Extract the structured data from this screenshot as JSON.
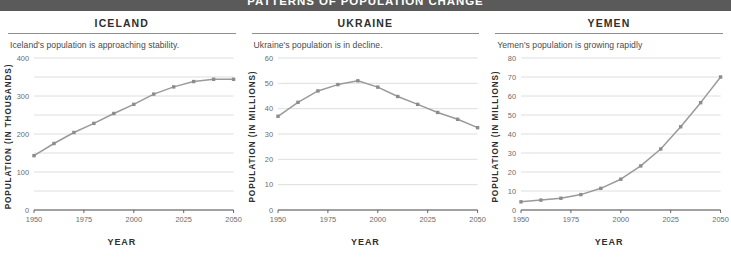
{
  "banner": {
    "title": "PATTERNS OF POPULATION CHANGE",
    "bg_color": "#5a5a5a",
    "text_color": "#ffffff"
  },
  "style": {
    "line_color": "#9a9a9a",
    "marker_color": "#8c8c8c",
    "grid_color": "#d6d6d6",
    "axis_color": "#555555",
    "tick_text_color": "#6b6b6b"
  },
  "panels": [
    {
      "country": "ICELAND",
      "subtitle": "Iceland's population is approaching stability.",
      "chart_index": 0
    },
    {
      "country": "UKRAINE",
      "subtitle": "Ukraine's population is in decline.",
      "chart_index": 1
    },
    {
      "country": "YEMEN",
      "subtitle": "Yemen's population is growing rapidly",
      "chart_index": 2
    }
  ],
  "chart_data": [
    {
      "type": "line",
      "title": "ICELAND",
      "xlabel": "YEAR",
      "ylabel": "POPULATION (IN THOUSANDS)",
      "x": [
        1950,
        1960,
        1970,
        1980,
        1990,
        2000,
        2010,
        2020,
        2030,
        2040,
        2050
      ],
      "values": [
        143,
        175,
        204,
        228,
        254,
        278,
        305,
        324,
        338,
        344,
        344
      ],
      "xlim": [
        1950,
        2050
      ],
      "ylim": [
        0,
        400
      ],
      "ytick_labels": [
        0,
        100,
        200,
        300,
        400
      ],
      "ygrid_step": 50,
      "xtick_labels": [
        1950,
        1975,
        2000,
        2025,
        2050
      ],
      "grid": true,
      "legend": "none",
      "marker": "square"
    },
    {
      "type": "line",
      "title": "UKRAINE",
      "xlabel": "YEAR",
      "ylabel": "POPULATION (IN MILLIONS)",
      "x": [
        1950,
        1960,
        1970,
        1980,
        1990,
        2000,
        2010,
        2020,
        2030,
        2040,
        2050
      ],
      "values": [
        37,
        42.5,
        47,
        49.5,
        51,
        48.5,
        44.8,
        41.7,
        38.5,
        35.8,
        32.5
      ],
      "xlim": [
        1950,
        2050
      ],
      "ylim": [
        0,
        60
      ],
      "ytick_labels": [
        0,
        10,
        20,
        30,
        40,
        50,
        60
      ],
      "ygrid_step": 10,
      "xtick_labels": [
        1950,
        1975,
        2000,
        2025,
        2050
      ],
      "grid": true,
      "legend": "none",
      "marker": "square"
    },
    {
      "type": "line",
      "title": "YEMEN",
      "xlabel": "YEAR",
      "ylabel": "POPULATION (IN MILLIONS)",
      "x": [
        1950,
        1960,
        1970,
        1980,
        1990,
        2000,
        2010,
        2020,
        2030,
        2040,
        2050
      ],
      "values": [
        4.3,
        5.2,
        6.2,
        8.1,
        11.4,
        16.2,
        23.2,
        32.1,
        43.8,
        56.5,
        70
      ],
      "xlim": [
        1950,
        2050
      ],
      "ylim": [
        0,
        80
      ],
      "ytick_labels": [
        0,
        10,
        20,
        30,
        40,
        50,
        60,
        70,
        80
      ],
      "ygrid_step": 10,
      "xtick_labels": [
        1950,
        1975,
        2000,
        2025,
        2050
      ],
      "grid": true,
      "legend": "none",
      "marker": "square"
    }
  ]
}
